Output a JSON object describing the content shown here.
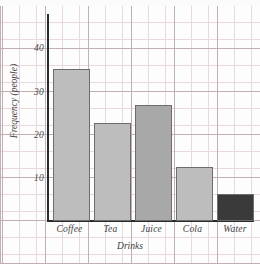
{
  "chart_data": {
    "type": "bar",
    "title": "",
    "categories": [
      "Coffee",
      "Tea",
      "Juice",
      "Cola",
      "Water"
    ],
    "values": [
      34,
      22,
      26,
      12,
      6
    ],
    "bar_colors": [
      "#bdbdbd",
      "#bdbdbd",
      "#a8a8a8",
      "#bdbdbd",
      "#3a3a3a"
    ],
    "xlabel": "Drinks",
    "ylabel": "Frequency (people)",
    "ylim": [
      0,
      45
    ],
    "yticks": [
      10,
      20,
      30,
      40
    ],
    "ytick_labels": [
      "10",
      "20",
      "30",
      "40"
    ],
    "grid": true,
    "legend": "none"
  },
  "axes": {
    "y_title": "Frequency (people)",
    "x_title": "Drinks",
    "y_tick_0": "10",
    "y_tick_1": "20",
    "y_tick_2": "30",
    "y_tick_3": "40",
    "x_tick_0": "Coffee",
    "x_tick_1": "Tea",
    "x_tick_2": "Juice",
    "x_tick_3": "Cola",
    "x_tick_4": "Water"
  },
  "colors": {
    "bar_light": "#bdbdbd",
    "bar_medium": "#a8a8a8",
    "bar_dark": "#3a3a3a",
    "axis": "#2b2b2b",
    "grid_major": "#b9a8ac",
    "grid_minor": "#e9d9dd",
    "paper": "#fdfdfd"
  }
}
